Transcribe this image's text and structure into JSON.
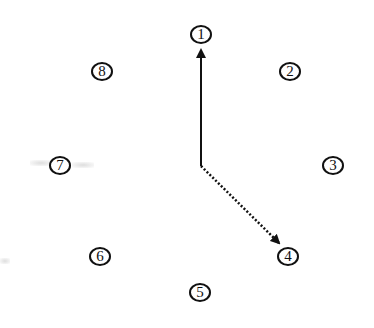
{
  "diagram": {
    "type": "clock-face-node-diagram",
    "nodes": [
      {
        "id": 1,
        "label": "1",
        "x": 201,
        "y": 34
      },
      {
        "id": 2,
        "label": "2",
        "x": 290,
        "y": 71
      },
      {
        "id": 3,
        "label": "3",
        "x": 333,
        "y": 165
      },
      {
        "id": 4,
        "label": "4",
        "x": 288,
        "y": 256
      },
      {
        "id": 5,
        "label": "5",
        "x": 200,
        "y": 292
      },
      {
        "id": 6,
        "label": "6",
        "x": 100,
        "y": 256
      },
      {
        "id": 7,
        "label": "7",
        "x": 60,
        "y": 165
      },
      {
        "id": 8,
        "label": "8",
        "x": 102,
        "y": 71
      }
    ],
    "center": {
      "x": 201,
      "y": 165
    },
    "arrows": [
      {
        "from": "center",
        "to": "1",
        "style": "solid",
        "color": "#111111"
      },
      {
        "from": "center",
        "to": "4",
        "style": "dotted",
        "color": "#111111"
      }
    ]
  }
}
